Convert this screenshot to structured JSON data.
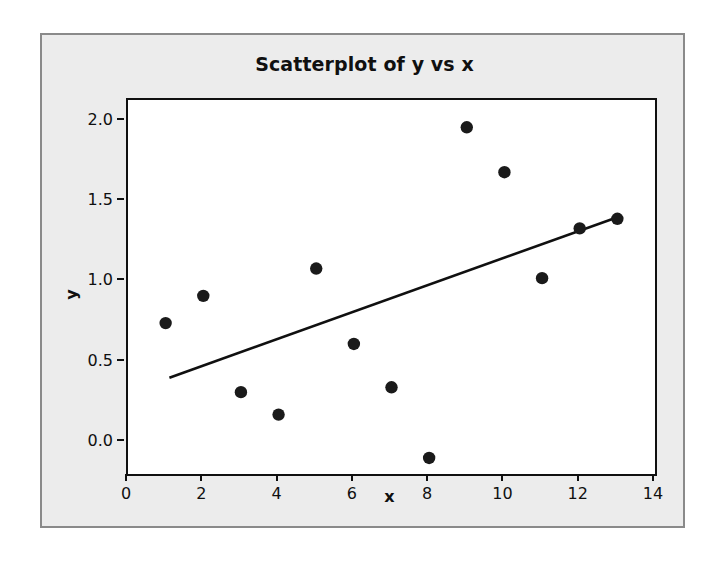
{
  "figure": {
    "title": "Scatterplot of y vs x",
    "background_color": "#ececec",
    "plot_background_color": "#ffffff",
    "frame_color": "#101010",
    "marker_color": "#1a1a1a",
    "line_color": "#101010"
  },
  "axes": {
    "x_title": "x",
    "y_title": "y",
    "x_ticks": [
      "0",
      "2",
      "4",
      "6",
      "8",
      "10",
      "12",
      "14"
    ],
    "y_ticks": [
      "0.0",
      "0.5",
      "1.0",
      "1.5",
      "2.0"
    ]
  },
  "chart_data": {
    "type": "scatter",
    "title": "Scatterplot of y vs x",
    "xlabel": "x",
    "ylabel": "y",
    "xlim": [
      0,
      14
    ],
    "ylim": [
      -0.2,
      2.13
    ],
    "grid": false,
    "legend": "none",
    "x_tick_values": [
      0,
      2,
      4,
      6,
      8,
      10,
      12,
      14
    ],
    "y_tick_values": [
      0.0,
      0.5,
      1.0,
      1.5,
      2.0
    ],
    "points": [
      {
        "x": 1,
        "y": 0.74
      },
      {
        "x": 2,
        "y": 0.91
      },
      {
        "x": 3,
        "y": 0.31
      },
      {
        "x": 4,
        "y": 0.17
      },
      {
        "x": 5,
        "y": 1.08
      },
      {
        "x": 6,
        "y": 0.61
      },
      {
        "x": 7,
        "y": 0.34
      },
      {
        "x": 8,
        "y": -0.1
      },
      {
        "x": 9,
        "y": 1.96
      },
      {
        "x": 10,
        "y": 1.68
      },
      {
        "x": 11,
        "y": 1.02
      },
      {
        "x": 12,
        "y": 1.33
      },
      {
        "x": 13,
        "y": 1.39
      }
    ],
    "fit_line": {
      "name": "regression-line",
      "x_start": 1.1,
      "y_start": 0.4,
      "x_end": 13.0,
      "y_end": 1.4
    }
  }
}
